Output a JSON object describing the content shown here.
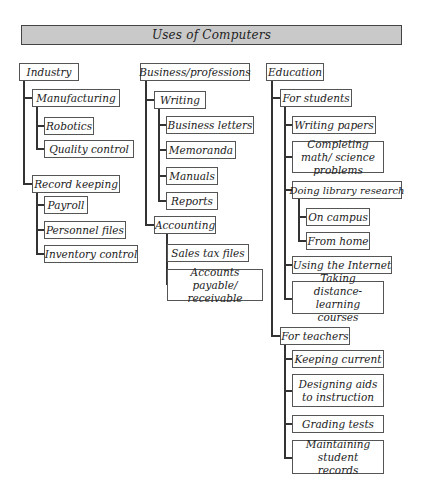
{
  "title": "Uses of Computers",
  "columns": [
    {
      "label": "Industry",
      "children": [
        {
          "label": "Manufacturing",
          "children": [
            {
              "label": "Robotics"
            },
            {
              "label": "Quality control"
            }
          ]
        },
        {
          "label": "Record keeping",
          "children": [
            {
              "label": "Payroll"
            },
            {
              "label": "Personnel files"
            },
            {
              "label": "Inventory control"
            }
          ]
        }
      ]
    },
    {
      "label": "Business/professions",
      "children": [
        {
          "label": "Writing",
          "children": [
            {
              "label": "Business letters"
            },
            {
              "label": "Memoranda"
            },
            {
              "label": "Manuals"
            },
            {
              "label": "Reports"
            }
          ]
        },
        {
          "label": "Accounting",
          "children": [
            {
              "label": "Sales tax files"
            },
            {
              "label": "Accounts payable/ receivable"
            }
          ]
        }
      ]
    },
    {
      "label": "Education",
      "children": [
        {
          "label": "For students",
          "children": [
            {
              "label": "Writing papers"
            },
            {
              "label": "Completing math/ science problems"
            },
            {
              "label": "Doing library research",
              "children": [
                {
                  "label": "On campus"
                },
                {
                  "label": "From home"
                }
              ]
            },
            {
              "label": "Using the Internet"
            },
            {
              "label": "Taking distance-learning courses"
            }
          ]
        },
        {
          "label": "For teachers",
          "children": [
            {
              "label": "Keeping current"
            },
            {
              "label": "Designing aids to instruction"
            },
            {
              "label": "Grading tests"
            },
            {
              "label": "Maintaining student records"
            }
          ]
        }
      ]
    }
  ]
}
